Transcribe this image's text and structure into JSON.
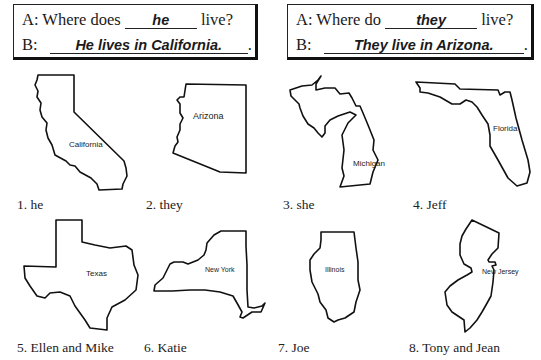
{
  "examples": [
    {
      "a_prefix": "A:  Where does",
      "a_answer": "he",
      "a_suffix": "live?",
      "b_prefix": "B:",
      "b_answer": "He lives in California.",
      "b_suffix": "."
    },
    {
      "a_prefix": "A:  Where do",
      "a_answer": "they",
      "a_suffix": "live?",
      "b_prefix": "B:",
      "b_answer": "They live in Arizona.",
      "b_suffix": "."
    }
  ],
  "items": [
    {
      "state": "California",
      "caption": "1.  he"
    },
    {
      "state": "Arizona",
      "caption": "2.  they"
    },
    {
      "state": "Michigan",
      "caption": "3.  she"
    },
    {
      "state": "Florida",
      "caption": "4.  Jeff"
    },
    {
      "state": "Texas",
      "caption": "5.  Ellen and Mike"
    },
    {
      "state": "New York",
      "caption": "6.  Katie"
    },
    {
      "state": "Illinois",
      "caption": "7.  Joe"
    },
    {
      "state": "New Jersey",
      "caption": "8.  Tony and Jean"
    }
  ]
}
